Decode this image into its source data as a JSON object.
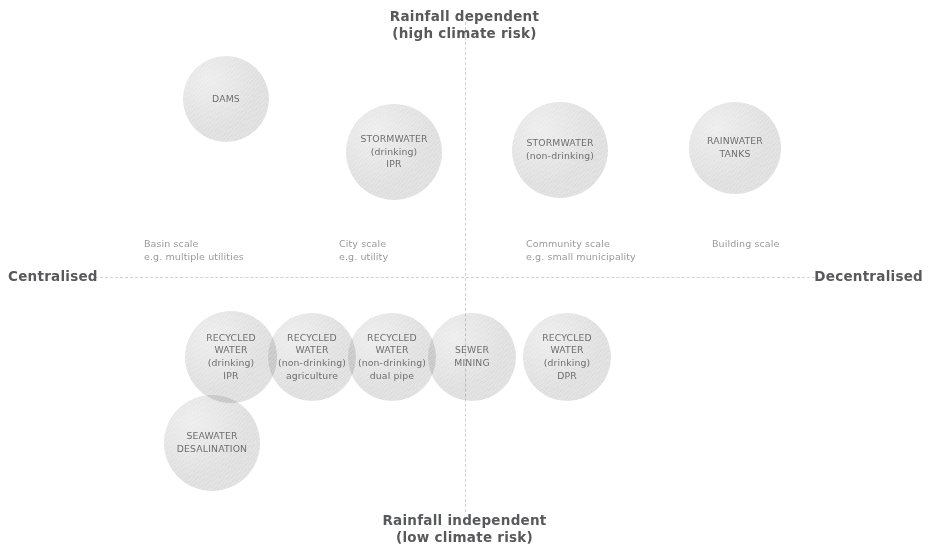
{
  "diagram": {
    "title_axes": {
      "top": "Rainfall dependent\n(high climate risk)",
      "bottom": "Rainfall independent\n(low climate risk)",
      "left": "Centralised",
      "right": "Decentralised"
    },
    "scale_labels": [
      {
        "text": "Basin scale\ne.g. multiple utilities",
        "x": 144,
        "y": 238
      },
      {
        "text": "City scale\ne.g. utility",
        "x": 339,
        "y": 238
      },
      {
        "text": "Community scale\ne.g. small municipality",
        "x": 526,
        "y": 238
      },
      {
        "text": "Building scale",
        "x": 712,
        "y": 238
      }
    ],
    "bubbles": [
      {
        "label": "DAMS",
        "cx": 226,
        "cy": 99,
        "r": 43,
        "quadrant": "top-left"
      },
      {
        "label": "STORMWATER\n(drinking)\nIPR",
        "cx": 394,
        "cy": 152,
        "r": 48,
        "quadrant": "top-left"
      },
      {
        "label": "STORMWATER\n(non-drinking)",
        "cx": 560,
        "cy": 150,
        "r": 48,
        "quadrant": "top-right"
      },
      {
        "label": "RAINWATER\nTANKS",
        "cx": 735,
        "cy": 148,
        "r": 46,
        "quadrant": "top-right"
      },
      {
        "label": "RECYCLED\nWATER\n(drinking)\nIPR",
        "cx": 231,
        "cy": 357,
        "r": 46,
        "quadrant": "bottom-left"
      },
      {
        "label": "RECYCLED\nWATER\n(non-drinking)\nagriculture",
        "cx": 312,
        "cy": 357,
        "r": 44,
        "quadrant": "bottom-left"
      },
      {
        "label": "RECYCLED\nWATER\n(non-drinking)\ndual pipe",
        "cx": 392,
        "cy": 357,
        "r": 44,
        "quadrant": "bottom-left"
      },
      {
        "label": "SEWER\nMINING",
        "cx": 472,
        "cy": 357,
        "r": 44,
        "quadrant": "bottom-center"
      },
      {
        "label": "RECYCLED\nWATER\n(drinking)\nDPR",
        "cx": 567,
        "cy": 357,
        "r": 44,
        "quadrant": "bottom-right"
      },
      {
        "label": "SEAWATER\nDESALINATION",
        "cx": 212,
        "cy": 443,
        "r": 48,
        "quadrant": "bottom-left"
      }
    ],
    "colors": {
      "bubble_fill": "#dedede",
      "bubble_text": "#6e6f71",
      "axis_line": "#d2d2d2",
      "pole_text": "#58595b",
      "scale_text": "#9a9a9a",
      "background": "#ffffff"
    }
  }
}
